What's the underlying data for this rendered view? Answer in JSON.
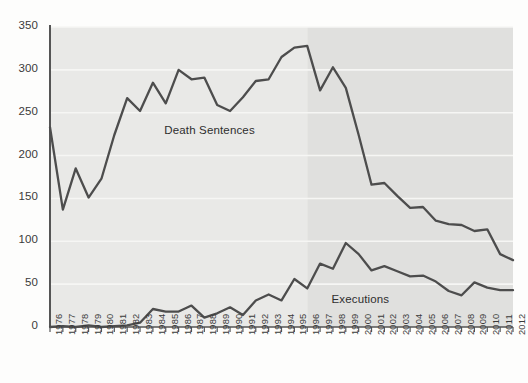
{
  "chart_data": {
    "type": "line",
    "title": "",
    "subtitle": "",
    "xlabel": "",
    "ylabel": "",
    "ylim": [
      0,
      350
    ],
    "ytick_step": 50,
    "yticks": [
      0,
      50,
      100,
      150,
      200,
      250,
      300,
      350
    ],
    "grid": true,
    "grid_axis": "y",
    "legend_position": "inline-annotation",
    "x": [
      "1976",
      "1977",
      "1978",
      "1979",
      "1980",
      "1981",
      "1982",
      "1983",
      "1984",
      "1985",
      "1986",
      "1987",
      "1988",
      "1989",
      "1990",
      "1991",
      "1992",
      "1993",
      "1994",
      "1995",
      "1996",
      "1997",
      "1998",
      "1999",
      "2000",
      "2001",
      "2002",
      "2003",
      "2004",
      "2005",
      "2006",
      "2007",
      "2008",
      "2009",
      "2010",
      "2011",
      "2012"
    ],
    "categories": [
      "1976",
      "1977",
      "1978",
      "1979",
      "1980",
      "1981",
      "1982",
      "1983",
      "1984",
      "1985",
      "1986",
      "1987",
      "1988",
      "1989",
      "1990",
      "1991",
      "1992",
      "1993",
      "1994",
      "1995",
      "1996",
      "1997",
      "1998",
      "1999",
      "2000",
      "2001",
      "2002",
      "2003",
      "2004",
      "2005",
      "2006",
      "2007",
      "2008",
      "2009",
      "2010",
      "2011",
      "2012"
    ],
    "series": [
      {
        "name": "Death Sentences",
        "color": "#4d4d4d",
        "values": [
          233,
          137,
          185,
          151,
          173,
          224,
          267,
          252,
          285,
          261,
          300,
          289,
          291,
          259,
          252,
          268,
          287,
          289,
          315,
          326,
          328,
          276,
          303,
          279,
          224,
          166,
          168,
          153,
          139,
          140,
          124,
          120,
          119,
          112,
          114,
          85,
          78
        ]
      },
      {
        "name": "Executions",
        "color": "#4d4d4d",
        "values": [
          0,
          1,
          0,
          2,
          0,
          1,
          2,
          5,
          21,
          18,
          18,
          25,
          11,
          16,
          23,
          14,
          31,
          38,
          31,
          56,
          45,
          74,
          68,
          98,
          85,
          66,
          71,
          65,
          59,
          60,
          53,
          42,
          37,
          52,
          46,
          43,
          43
        ]
      }
    ],
    "annotations": [
      {
        "text": "Death Sentences",
        "x_value": "1988",
        "y_value": 228
      },
      {
        "text": "Executions",
        "x_value": "2001",
        "y_value": 30
      }
    ],
    "shaded_band": {
      "from": "1996",
      "to": "2012",
      "color": "#e2e2e0"
    },
    "plot_background": "#e8e8e6"
  }
}
